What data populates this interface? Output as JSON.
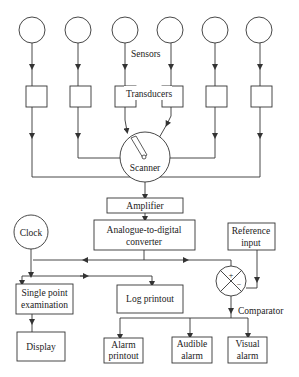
{
  "diagram": {
    "labels": {
      "sensors": "Sensors",
      "transducers": "Transducers",
      "scanner": "Scanner",
      "amplifier": "Amplifier",
      "adc_line1": "Analogue-to-digital",
      "adc_line2": "converter",
      "clock": "Clock",
      "reference_line1": "Reference",
      "reference_line2": "input",
      "comparator": "Comparator",
      "comparator_plus": "+",
      "comparator_minus": "−",
      "single_point_line1": "Single point",
      "single_point_line2": "examination",
      "log_printout": "Log printout",
      "display": "Display",
      "alarm_printout_line1": "Alarm",
      "alarm_printout_line2": "printout",
      "audible_alarm_line1": "Audible",
      "audible_alarm_line2": "alarm",
      "visual_alarm_line1": "Visual",
      "visual_alarm_line2": "alarm"
    },
    "sensor_count": 6,
    "transducer_count": 6,
    "flow": [
      "Sensors -> Transducers",
      "Transducers -> Scanner",
      "Scanner -> Amplifier",
      "Amplifier -> Analogue-to-digital converter",
      "Analogue-to-digital converter -> Single point examination",
      "Analogue-to-digital converter -> Log printout",
      "Analogue-to-digital converter -> Comparator (+)",
      "Clock -> Single point examination",
      "Clock -> Log printout",
      "Reference input -> Comparator (-)",
      "Single point examination -> Display",
      "Comparator -> Alarm printout",
      "Comparator -> Audible alarm",
      "Comparator -> Visual alarm"
    ]
  }
}
